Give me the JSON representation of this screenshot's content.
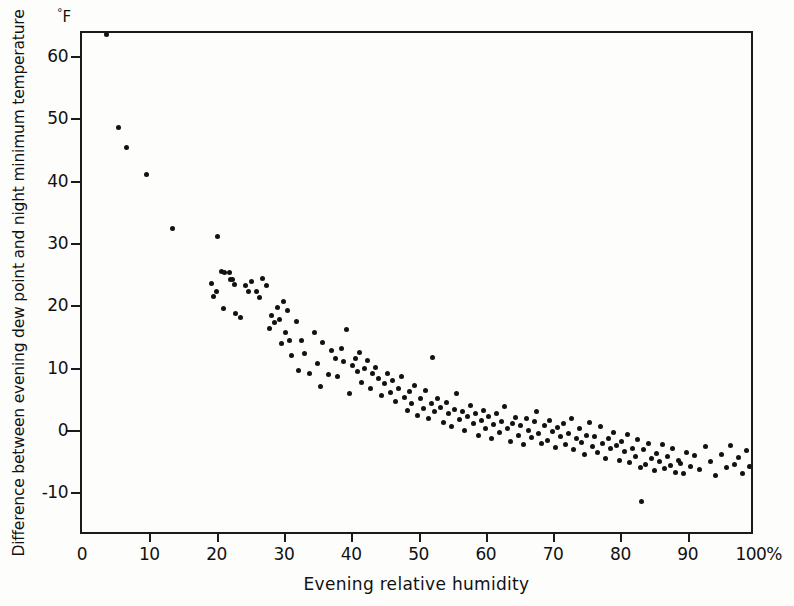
{
  "figure": {
    "background": "#fdfdfb",
    "frame_color": "#1a1a1a",
    "point_color": "#121212"
  },
  "axis": {
    "y_unit_label": "F",
    "y_unit_degree": "°",
    "x_percent_suffix": "%"
  },
  "chart_data": {
    "type": "scatter",
    "title": "",
    "xlabel": "Evening relative humidity",
    "ylabel": "Difference between evening dew point and night minimum temperature",
    "y_unit": "°F",
    "xlim": [
      0,
      100
    ],
    "ylim": [
      -17,
      63.7
    ],
    "xticks": [
      0,
      10,
      20,
      30,
      40,
      50,
      60,
      70,
      80,
      90,
      100
    ],
    "xticklabels": [
      "0",
      "10",
      "20",
      "30",
      "40",
      "50",
      "60",
      "70",
      "80",
      "90",
      "100%"
    ],
    "yticks": [
      -10,
      0,
      10,
      20,
      30,
      40,
      50,
      60
    ],
    "yticklabels": [
      "-10",
      "0",
      "10",
      "20",
      "30",
      "40",
      "50",
      "60"
    ],
    "grid": false,
    "legend": null,
    "series": [
      {
        "name": "observations",
        "marker": "filled-circle",
        "color": "#121212",
        "points": [
          [
            3.7,
            63.5
          ],
          [
            5.4,
            48.6
          ],
          [
            6.6,
            45.4
          ],
          [
            9.6,
            41.0
          ],
          [
            13.4,
            32.3
          ],
          [
            19.3,
            23.5
          ],
          [
            19.6,
            21.5
          ],
          [
            20.0,
            22.2
          ],
          [
            20.1,
            31.0
          ],
          [
            20.8,
            25.5
          ],
          [
            21.0,
            19.5
          ],
          [
            21.2,
            25.3
          ],
          [
            21.9,
            25.3
          ],
          [
            22.1,
            24.2
          ],
          [
            22.4,
            24.1
          ],
          [
            22.6,
            23.4
          ],
          [
            22.8,
            18.7
          ],
          [
            23.5,
            18.0
          ],
          [
            24.3,
            23.2
          ],
          [
            24.8,
            22.3
          ],
          [
            25.2,
            23.9
          ],
          [
            26.0,
            22.2
          ],
          [
            26.4,
            21.2
          ],
          [
            26.8,
            24.3
          ],
          [
            27.4,
            23.2
          ],
          [
            27.9,
            16.3
          ],
          [
            28.2,
            18.3
          ],
          [
            28.6,
            17.2
          ],
          [
            29.0,
            19.6
          ],
          [
            29.4,
            17.8
          ],
          [
            29.6,
            13.9
          ],
          [
            30.0,
            20.6
          ],
          [
            30.2,
            15.6
          ],
          [
            30.6,
            19.2
          ],
          [
            30.9,
            14.4
          ],
          [
            31.1,
            12.0
          ],
          [
            31.8,
            17.4
          ],
          [
            32.2,
            9.6
          ],
          [
            32.6,
            14.4
          ],
          [
            33.1,
            12.3
          ],
          [
            33.8,
            9.1
          ],
          [
            34.5,
            15.7
          ],
          [
            35.0,
            10.6
          ],
          [
            35.4,
            7.0
          ],
          [
            35.8,
            14.0
          ],
          [
            36.6,
            8.9
          ],
          [
            37.1,
            12.7
          ],
          [
            37.6,
            11.4
          ],
          [
            38.0,
            8.6
          ],
          [
            38.5,
            13.1
          ],
          [
            38.9,
            11.0
          ],
          [
            39.3,
            16.2
          ],
          [
            39.7,
            5.9
          ],
          [
            40.2,
            10.4
          ],
          [
            40.6,
            11.5
          ],
          [
            40.9,
            9.4
          ],
          [
            41.3,
            12.5
          ],
          [
            41.6,
            7.6
          ],
          [
            42.0,
            9.8
          ],
          [
            42.4,
            11.2
          ],
          [
            42.8,
            6.6
          ],
          [
            43.2,
            9.0
          ],
          [
            43.6,
            10.1
          ],
          [
            44.1,
            8.2
          ],
          [
            44.5,
            5.5
          ],
          [
            44.9,
            7.4
          ],
          [
            45.4,
            9.1
          ],
          [
            45.8,
            6.0
          ],
          [
            46.2,
            7.9
          ],
          [
            46.6,
            4.6
          ],
          [
            47.0,
            6.7
          ],
          [
            47.4,
            8.6
          ],
          [
            47.9,
            5.2
          ],
          [
            48.3,
            3.1
          ],
          [
            48.7,
            6.2
          ],
          [
            49.0,
            4.2
          ],
          [
            49.4,
            7.1
          ],
          [
            49.8,
            2.4
          ],
          [
            50.3,
            5.0
          ],
          [
            50.7,
            3.5
          ],
          [
            51.1,
            6.3
          ],
          [
            51.5,
            1.8
          ],
          [
            51.9,
            4.3
          ],
          [
            52.1,
            11.6
          ],
          [
            52.4,
            2.9
          ],
          [
            52.8,
            5.1
          ],
          [
            53.2,
            3.6
          ],
          [
            53.7,
            1.2
          ],
          [
            54.1,
            4.4
          ],
          [
            54.5,
            2.6
          ],
          [
            54.9,
            0.6
          ],
          [
            55.3,
            3.3
          ],
          [
            55.7,
            5.8
          ],
          [
            56.1,
            1.7
          ],
          [
            56.5,
            3.0
          ],
          [
            56.9,
            0.0
          ],
          [
            57.3,
            2.1
          ],
          [
            57.7,
            4.0
          ],
          [
            58.1,
            1.0
          ],
          [
            58.5,
            2.7
          ],
          [
            58.9,
            -0.8
          ],
          [
            59.3,
            1.5
          ],
          [
            59.7,
            3.2
          ],
          [
            60.0,
            0.2
          ],
          [
            60.4,
            2.2
          ],
          [
            60.8,
            -1.4
          ],
          [
            61.2,
            0.9
          ],
          [
            61.6,
            2.6
          ],
          [
            62.0,
            -0.4
          ],
          [
            62.4,
            1.4
          ],
          [
            62.8,
            3.8
          ],
          [
            63.2,
            0.3
          ],
          [
            63.6,
            -1.9
          ],
          [
            64.0,
            1.1
          ],
          [
            64.4,
            2.0
          ],
          [
            64.8,
            -0.9
          ],
          [
            65.2,
            0.7
          ],
          [
            65.6,
            -2.4
          ],
          [
            66.0,
            1.9
          ],
          [
            66.4,
            0.0
          ],
          [
            66.8,
            -1.2
          ],
          [
            67.2,
            1.3
          ],
          [
            67.5,
            3.0
          ],
          [
            67.9,
            -0.5
          ],
          [
            68.3,
            -2.1
          ],
          [
            68.7,
            0.8
          ],
          [
            69.1,
            -1.6
          ],
          [
            69.5,
            1.6
          ],
          [
            69.9,
            -0.2
          ],
          [
            70.3,
            -2.8
          ],
          [
            70.7,
            0.4
          ],
          [
            71.1,
            -1.1
          ],
          [
            71.5,
            1.0
          ],
          [
            71.9,
            -2.3
          ],
          [
            72.3,
            -0.6
          ],
          [
            72.7,
            1.8
          ],
          [
            73.1,
            -3.1
          ],
          [
            73.5,
            -1.4
          ],
          [
            73.9,
            0.2
          ],
          [
            74.2,
            -2.0
          ],
          [
            74.6,
            -4.0
          ],
          [
            75.0,
            -0.9
          ],
          [
            75.4,
            1.2
          ],
          [
            75.8,
            -2.6
          ],
          [
            76.2,
            -1.0
          ],
          [
            76.6,
            -3.6
          ],
          [
            77.0,
            0.6
          ],
          [
            77.4,
            -2.2
          ],
          [
            77.8,
            -4.5
          ],
          [
            78.2,
            -1.3
          ],
          [
            78.6,
            -3.0
          ],
          [
            79.0,
            -0.4
          ],
          [
            79.4,
            -2.5
          ],
          [
            79.8,
            -4.9
          ],
          [
            80.2,
            -1.8
          ],
          [
            80.6,
            -3.4
          ],
          [
            81.0,
            -0.7
          ],
          [
            81.4,
            -5.2
          ],
          [
            81.8,
            -2.9
          ],
          [
            82.2,
            -4.2
          ],
          [
            82.6,
            -1.5
          ],
          [
            83.0,
            -6.0
          ],
          [
            83.2,
            -11.4
          ],
          [
            83.4,
            -3.2
          ],
          [
            83.8,
            -5.5
          ],
          [
            84.2,
            -2.1
          ],
          [
            84.6,
            -4.6
          ],
          [
            85.0,
            -6.5
          ],
          [
            85.4,
            -3.8
          ],
          [
            85.8,
            -5.0
          ],
          [
            86.2,
            -2.4
          ],
          [
            86.6,
            -6.2
          ],
          [
            87.0,
            -4.3
          ],
          [
            87.4,
            -5.7
          ],
          [
            87.8,
            -3.0
          ],
          [
            88.2,
            -6.8
          ],
          [
            88.6,
            -4.9
          ],
          [
            89.0,
            -5.4
          ],
          [
            89.4,
            -7.0
          ],
          [
            89.8,
            -3.6
          ],
          [
            90.4,
            -5.9
          ],
          [
            91.0,
            -4.1
          ],
          [
            91.8,
            -6.4
          ],
          [
            92.6,
            -2.7
          ],
          [
            93.4,
            -5.1
          ],
          [
            94.2,
            -7.3
          ],
          [
            95.0,
            -3.9
          ],
          [
            95.8,
            -6.0
          ],
          [
            96.4,
            -2.5
          ],
          [
            97.0,
            -5.6
          ],
          [
            97.6,
            -4.4
          ],
          [
            98.2,
            -6.9
          ],
          [
            98.8,
            -3.3
          ],
          [
            99.2,
            -5.8
          ]
        ]
      }
    ]
  }
}
